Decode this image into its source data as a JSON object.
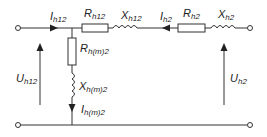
{
  "diagram": {
    "type": "equivalent-circuit",
    "labels": {
      "I_h12": {
        "main": "I",
        "sub": "h12"
      },
      "R_h12": {
        "main": "R",
        "sub": "h12"
      },
      "X_h12": {
        "main": "X",
        "sub": "h12"
      },
      "I_h2": {
        "main": "I",
        "sub": "h2"
      },
      "R_h2": {
        "main": "R",
        "sub": "h2"
      },
      "X_h2": {
        "main": "X",
        "sub": "h2"
      },
      "R_hm2": {
        "main": "R",
        "sub": "h(m)2"
      },
      "X_hm2": {
        "main": "X",
        "sub": "h(m)2"
      },
      "I_hm2": {
        "main": "I",
        "sub": "h(m)2"
      },
      "U_h12": {
        "main": "U",
        "sub": "h12"
      },
      "U_h2": {
        "main": "U",
        "sub": "h2"
      }
    },
    "colors": {
      "wire": "#333333",
      "component_fill": "#ffffff"
    }
  }
}
